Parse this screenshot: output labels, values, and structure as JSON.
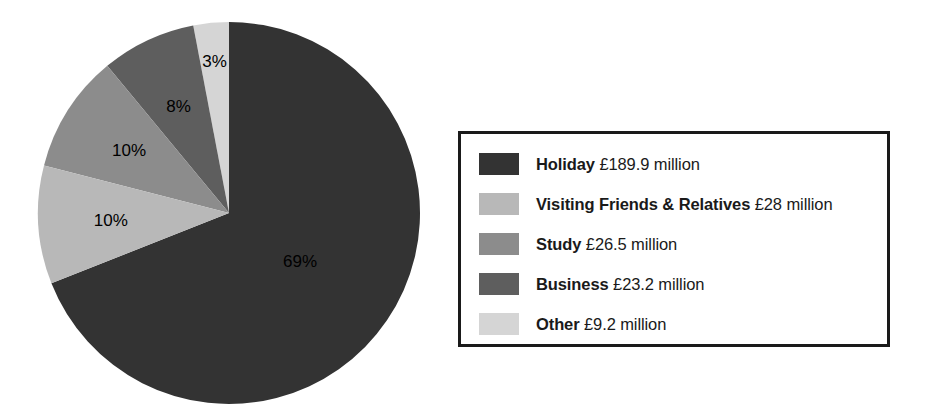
{
  "chart_data": {
    "type": "pie",
    "title": "",
    "subtitle": "",
    "xlabel": "",
    "ylabel": "",
    "unit": "£ million",
    "legend_position": "right",
    "grid": false,
    "total_label": "",
    "categories": [
      "Holiday",
      "Visiting Friends & Relatives",
      "Study",
      "Business",
      "Other"
    ],
    "values": [
      189.9,
      28,
      26.5,
      23.2,
      9.2
    ],
    "percent_values": [
      69,
      10,
      10,
      8,
      3
    ],
    "percent_labels": [
      "69%",
      "10%",
      "10%",
      "8%",
      "3%"
    ],
    "value_labels": [
      "£189.9 million",
      "£28 million",
      "£26.5 million",
      "£23.2 million",
      "£9.2 million"
    ],
    "colors": [
      "#333333",
      "#b8b8b8",
      "#8c8c8c",
      "#5e5e5e",
      "#d5d5d5"
    ],
    "slices": [
      {
        "name": "Holiday",
        "percent": 69,
        "percent_label": "69%",
        "value": 189.9,
        "value_label": "£189.9 million",
        "color": "#333333"
      },
      {
        "name": "Visiting Friends & Relatives",
        "percent": 10,
        "percent_label": "10%",
        "value": 28,
        "value_label": "£28 million",
        "color": "#b8b8b8"
      },
      {
        "name": "Study",
        "percent": 10,
        "percent_label": "10%",
        "value": 26.5,
        "value_label": "£26.5 million",
        "color": "#8c8c8c"
      },
      {
        "name": "Business",
        "percent": 8,
        "percent_label": "8%",
        "value": 23.2,
        "value_label": "£23.2 million",
        "color": "#5e5e5e"
      },
      {
        "name": "Other",
        "percent": 3,
        "percent_label": "3%",
        "value": 9.2,
        "value_label": "£9.2 million",
        "color": "#d5d5d5"
      }
    ]
  },
  "legend": {
    "border_color": "#1a1a1a",
    "rows": [
      {
        "name": "Holiday",
        "value": "£189.9 million",
        "color": "#333333"
      },
      {
        "name": "Visiting Friends & Relatives",
        "value": "£28 million",
        "color": "#b8b8b8"
      },
      {
        "name": "Study",
        "value": "£26.5 million",
        "color": "#8c8c8c"
      },
      {
        "name": "Business",
        "value": "£23.2 million",
        "color": "#5e5e5e"
      },
      {
        "name": "Other",
        "value": "£9.2 million",
        "color": "#d5d5d5"
      }
    ]
  }
}
